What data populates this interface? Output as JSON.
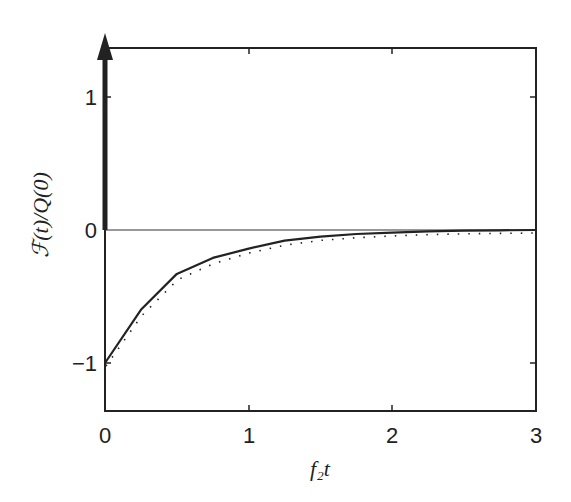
{
  "chart_data": {
    "type": "line",
    "title": "",
    "xlabel": "f₂t",
    "ylabel": "ℱ(t)/Q(0)",
    "xlim": [
      0,
      3
    ],
    "ylim": [
      -1.35,
      1.35
    ],
    "xticks": [
      0,
      1,
      2,
      3
    ],
    "yticks": [
      -1,
      0,
      1
    ],
    "xtick_labels": [
      "0",
      "1",
      "2",
      "3"
    ],
    "ytick_labels": [
      "−1",
      "0",
      "1"
    ],
    "grid": false,
    "legend": null,
    "annotations": [
      {
        "type": "delta-arrow",
        "x": 0,
        "from_y": 0,
        "to_y": 1.35,
        "description": "thick upward arrow at t=0 (delta function)"
      },
      {
        "type": "hline",
        "y": 0
      }
    ],
    "series": [
      {
        "name": "solid",
        "style": "solid",
        "x": [
          0,
          0.25,
          0.5,
          0.75,
          1.0,
          1.25,
          1.5,
          1.75,
          2.0,
          2.25,
          2.5,
          2.75,
          3.0
        ],
        "y": [
          -1.0,
          -0.6,
          -0.33,
          -0.21,
          -0.14,
          -0.08,
          -0.05,
          -0.03,
          -0.02,
          -0.01,
          -0.005,
          -0.002,
          0.0
        ]
      },
      {
        "name": "dotted",
        "style": "dotted",
        "x": [
          0,
          0.25,
          0.5,
          0.75,
          1.0,
          1.25,
          1.5,
          1.75,
          2.0,
          2.25,
          2.5,
          2.75,
          3.0
        ],
        "y": [
          -1.0,
          -0.62,
          -0.35,
          -0.23,
          -0.15,
          -0.09,
          -0.055,
          -0.035,
          -0.022,
          -0.012,
          -0.006,
          -0.003,
          0.0
        ]
      }
    ]
  }
}
